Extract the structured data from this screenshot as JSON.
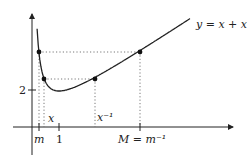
{
  "diagram": {
    "curve_label": "y = x + x⁻¹",
    "function": "x + 1/x",
    "axis_labels": {
      "m": "m",
      "one": "1",
      "M": "M = m⁻¹",
      "x": "x",
      "x_inv": "x⁻¹",
      "two": "2"
    },
    "points": [
      {
        "name": "m",
        "x": 0.26
      },
      {
        "name": "x",
        "x": 0.44
      },
      {
        "name": "x_inv",
        "x": 2.27
      },
      {
        "name": "M",
        "x": 3.85
      }
    ],
    "colors": {
      "curve": "#222222",
      "dotted": "#555555"
    }
  }
}
